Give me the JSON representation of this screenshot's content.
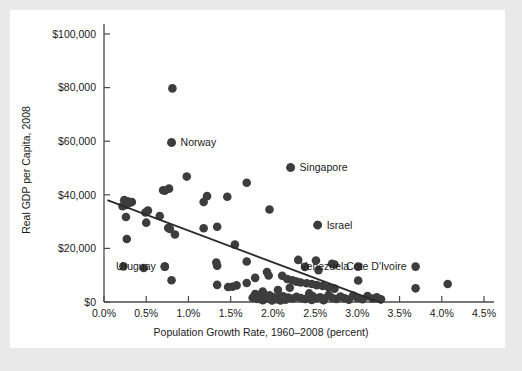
{
  "chart_data": {
    "type": "scatter",
    "title": "",
    "xlabel": "Population Growth Rate, 1960–2008 (percent)",
    "ylabel": "Real GDP per Capita, 2008",
    "xlim": [
      0.0,
      4.5
    ],
    "ylim": [
      0,
      100000
    ],
    "grid": false,
    "legend": "none",
    "xticks": [
      "0.0%",
      "0.5%",
      "1.0%",
      "1.5%",
      "2.0%",
      "2.5%",
      "3.0%",
      "3.5%",
      "4.0%",
      "4.5%"
    ],
    "xtick_values": [
      0.0,
      0.5,
      1.0,
      1.5,
      2.0,
      2.5,
      3.0,
      3.5,
      4.0,
      4.5
    ],
    "yticks": [
      "$0",
      "$20,000",
      "$40,000",
      "$60,000",
      "$80,000",
      "$100,000"
    ],
    "ytick_values": [
      0,
      20000,
      40000,
      60000,
      80000,
      100000
    ],
    "trendline": {
      "type": "linear-fit",
      "x_start": 0.04,
      "y_start": 38000,
      "x_end": 3.29,
      "y_end": -400
    },
    "annotations": [
      {
        "label": "Norway",
        "x": 0.8,
        "y": 59500,
        "anchor": "right"
      },
      {
        "label": "Singapore",
        "x": 2.21,
        "y": 50200,
        "anchor": "right"
      },
      {
        "label": "Israel",
        "x": 2.53,
        "y": 28700,
        "anchor": "right"
      },
      {
        "label": "Uruguay",
        "x": 0.72,
        "y": 13200,
        "anchor": "left"
      },
      {
        "label": "Venezuela",
        "x": 3.01,
        "y": 13200,
        "anchor": "left"
      },
      {
        "label": "Cote D'Ivoire",
        "x": 3.69,
        "y": 13200,
        "anchor": "left"
      }
    ],
    "points": [
      {
        "x": 0.81,
        "y": 79700
      },
      {
        "x": 0.8,
        "y": 59500
      },
      {
        "x": 2.21,
        "y": 50200
      },
      {
        "x": 0.98,
        "y": 46800
      },
      {
        "x": 1.69,
        "y": 44500
      },
      {
        "x": 0.77,
        "y": 42300
      },
      {
        "x": 0.7,
        "y": 41700
      },
      {
        "x": 0.72,
        "y": 41500
      },
      {
        "x": 1.22,
        "y": 39500
      },
      {
        "x": 1.46,
        "y": 39300
      },
      {
        "x": 0.24,
        "y": 38000
      },
      {
        "x": 0.28,
        "y": 37600
      },
      {
        "x": 0.33,
        "y": 37300
      },
      {
        "x": 0.3,
        "y": 37000
      },
      {
        "x": 0.26,
        "y": 36200
      },
      {
        "x": 0.22,
        "y": 35700
      },
      {
        "x": 1.18,
        "y": 37300
      },
      {
        "x": 1.96,
        "y": 34500
      },
      {
        "x": 0.52,
        "y": 34100
      },
      {
        "x": 0.49,
        "y": 33400
      },
      {
        "x": 0.26,
        "y": 31700
      },
      {
        "x": 0.66,
        "y": 32100
      },
      {
        "x": 0.5,
        "y": 29600
      },
      {
        "x": 2.53,
        "y": 28700
      },
      {
        "x": 0.76,
        "y": 27600
      },
      {
        "x": 0.78,
        "y": 27300
      },
      {
        "x": 1.18,
        "y": 27500
      },
      {
        "x": 1.34,
        "y": 28100
      },
      {
        "x": 0.84,
        "y": 25200
      },
      {
        "x": 0.27,
        "y": 23500
      },
      {
        "x": 1.55,
        "y": 21400
      },
      {
        "x": 1.69,
        "y": 15100
      },
      {
        "x": 2.3,
        "y": 15700
      },
      {
        "x": 2.51,
        "y": 15500
      },
      {
        "x": 2.7,
        "y": 14300
      },
      {
        "x": 2.73,
        "y": 14000
      },
      {
        "x": 1.33,
        "y": 14700
      },
      {
        "x": 1.34,
        "y": 13500
      },
      {
        "x": 0.23,
        "y": 13300
      },
      {
        "x": 0.47,
        "y": 12700
      },
      {
        "x": 0.72,
        "y": 13200
      },
      {
        "x": 2.38,
        "y": 13100
      },
      {
        "x": 2.54,
        "y": 11900
      },
      {
        "x": 1.93,
        "y": 11200
      },
      {
        "x": 3.01,
        "y": 8000
      },
      {
        "x": 3.69,
        "y": 5100
      },
      {
        "x": 4.07,
        "y": 6700
      },
      {
        "x": 0.8,
        "y": 8100
      },
      {
        "x": 1.34,
        "y": 6400
      },
      {
        "x": 1.47,
        "y": 5600
      },
      {
        "x": 1.52,
        "y": 5700
      },
      {
        "x": 1.57,
        "y": 6200
      },
      {
        "x": 1.69,
        "y": 7100
      },
      {
        "x": 1.79,
        "y": 9000
      },
      {
        "x": 1.95,
        "y": 9900
      },
      {
        "x": 2.11,
        "y": 9800
      },
      {
        "x": 2.17,
        "y": 8600
      },
      {
        "x": 2.23,
        "y": 8100
      },
      {
        "x": 2.28,
        "y": 7600
      },
      {
        "x": 2.33,
        "y": 7300
      },
      {
        "x": 2.4,
        "y": 7000
      },
      {
        "x": 2.46,
        "y": 6700
      },
      {
        "x": 2.52,
        "y": 6300
      },
      {
        "x": 2.59,
        "y": 6000
      },
      {
        "x": 2.66,
        "y": 5500
      },
      {
        "x": 2.73,
        "y": 5000
      },
      {
        "x": 2.2,
        "y": 5300
      },
      {
        "x": 2.06,
        "y": 4500
      },
      {
        "x": 1.88,
        "y": 3900
      },
      {
        "x": 1.79,
        "y": 3000
      },
      {
        "x": 1.84,
        "y": 2600
      },
      {
        "x": 1.9,
        "y": 2200
      },
      {
        "x": 1.96,
        "y": 2500
      },
      {
        "x": 2.01,
        "y": 1800
      },
      {
        "x": 2.07,
        "y": 1500
      },
      {
        "x": 2.12,
        "y": 2100
      },
      {
        "x": 2.18,
        "y": 1700
      },
      {
        "x": 2.23,
        "y": 1300
      },
      {
        "x": 2.28,
        "y": 1900
      },
      {
        "x": 2.33,
        "y": 1500
      },
      {
        "x": 2.38,
        "y": 1100
      },
      {
        "x": 2.43,
        "y": 3200
      },
      {
        "x": 2.47,
        "y": 2200
      },
      {
        "x": 2.51,
        "y": 1400
      },
      {
        "x": 2.56,
        "y": 1800
      },
      {
        "x": 2.61,
        "y": 1200
      },
      {
        "x": 2.66,
        "y": 2600
      },
      {
        "x": 2.7,
        "y": 1600
      },
      {
        "x": 2.75,
        "y": 1100
      },
      {
        "x": 2.8,
        "y": 2000
      },
      {
        "x": 2.85,
        "y": 1400
      },
      {
        "x": 2.9,
        "y": 900
      },
      {
        "x": 2.95,
        "y": 2400
      },
      {
        "x": 3.0,
        "y": 1500
      },
      {
        "x": 3.06,
        "y": 1000
      },
      {
        "x": 3.12,
        "y": 2200
      },
      {
        "x": 3.18,
        "y": 1300
      },
      {
        "x": 3.23,
        "y": 1800
      },
      {
        "x": 3.28,
        "y": 1000
      },
      {
        "x": 1.76,
        "y": 1600
      },
      {
        "x": 1.82,
        "y": 1100
      },
      {
        "x": 1.88,
        "y": 700
      },
      {
        "x": 1.93,
        "y": 1300
      },
      {
        "x": 1.99,
        "y": 600
      },
      {
        "x": 2.04,
        "y": 1000
      },
      {
        "x": 2.09,
        "y": 600
      },
      {
        "x": 2.15,
        "y": 900
      },
      {
        "x": 2.6,
        "y": 700
      },
      {
        "x": 2.46,
        "y": 800
      }
    ]
  }
}
